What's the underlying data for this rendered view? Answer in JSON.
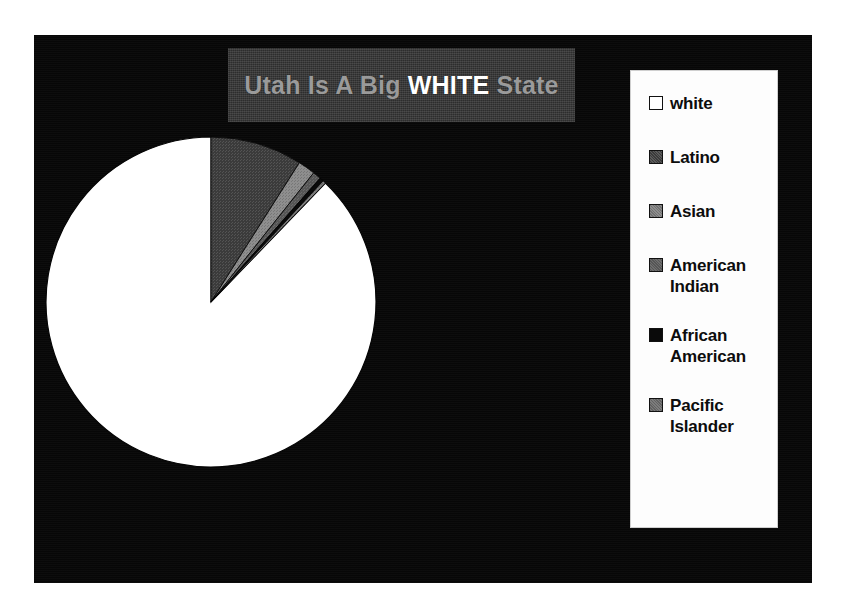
{
  "title": {
    "prefix": "Utah Is A Big ",
    "highlight": "WHITE",
    "suffix": " State",
    "full": "Utah Is A Big WHITE State"
  },
  "colors": {
    "plate_background": "#070707",
    "title_band": "#2d2d2d",
    "title_text": "#9a9a9a",
    "title_highlight": "#ffffff",
    "legend_background": "#fdfdfd",
    "legend_text": "#0d0d0d"
  },
  "legend": {
    "position": "right",
    "items": [
      {
        "label": "white",
        "swatch": "#ffffff",
        "swatch_class": "sw-white"
      },
      {
        "label": "Latino",
        "swatch": "#3b3b3b",
        "swatch_class": "sw-dark"
      },
      {
        "label": "Asian",
        "swatch": "#8e8e8e",
        "swatch_class": "sw-mid"
      },
      {
        "label": "American Indian",
        "swatch": "#565656",
        "swatch_class": "sw-darkmid"
      },
      {
        "label": "African American",
        "swatch": "#0a0a0a",
        "swatch_class": "sw-black"
      },
      {
        "label": "Pacific Islander",
        "swatch": "#7d7d7d",
        "swatch_class": "sw-mid2"
      }
    ]
  },
  "chart_data": {
    "type": "pie",
    "title": "Utah Is A Big WHITE State",
    "xlabel": "",
    "ylabel": "",
    "legend_position": "right",
    "grid": false,
    "start_angle_deg": 90,
    "direction": "counterclockwise",
    "units": "percent",
    "categories": [
      "white",
      "Latino",
      "Asian",
      "American Indian",
      "African American",
      "Pacific Islander"
    ],
    "values": [
      87.8,
      9.0,
      1.7,
      0.8,
      0.4,
      0.3
    ],
    "slices": [
      {
        "label": "white",
        "value": 87.8,
        "color": "#ffffff",
        "start_deg": 90.0,
        "end_deg": 406.1
      },
      {
        "label": "Latino",
        "value": 9.0,
        "color": "#3b3b3b",
        "start_deg": 57.6,
        "end_deg": 90.0
      },
      {
        "label": "Asian",
        "value": 1.7,
        "color": "#8e8e8e",
        "start_deg": 51.5,
        "end_deg": 57.6
      },
      {
        "label": "American Indian",
        "value": 0.8,
        "color": "#565656",
        "start_deg": 48.6,
        "end_deg": 51.5
      },
      {
        "label": "African American",
        "value": 0.4,
        "color": "#0a0a0a",
        "start_deg": 47.2,
        "end_deg": 48.6
      },
      {
        "label": "Pacific Islander",
        "value": 0.3,
        "color": "#7d7d7d",
        "start_deg": 46.1,
        "end_deg": 47.2
      }
    ]
  }
}
